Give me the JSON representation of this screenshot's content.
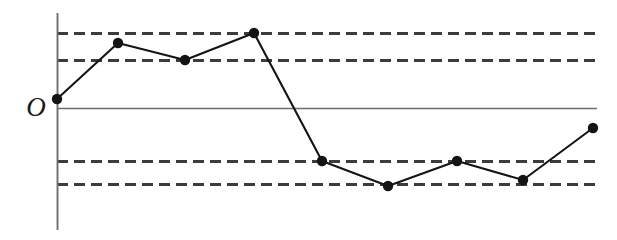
{
  "chart_data": {
    "type": "line",
    "title": "",
    "subtitle": "",
    "xlabel": "",
    "ylabel": "",
    "origin_label": "O",
    "grid": true,
    "legend": null,
    "annotations": [],
    "x": [
      1,
      2,
      3,
      4,
      5,
      6,
      7,
      8,
      9
    ],
    "xtick_labels": [
      "",
      "",
      "",
      "",
      "",
      "",
      "",
      "",
      ""
    ],
    "values": [
      0,
      3.8,
      3.2,
      4,
      -1.8,
      -2.7,
      -1.8,
      -2.5,
      -0.7
    ],
    "series": [
      {
        "name": "series-1",
        "values": [
          0,
          3.8,
          3.2,
          4,
          -1.8,
          -2.7,
          -1.8,
          -2.5,
          -0.7
        ]
      }
    ],
    "ylim": [
      -4.2,
      4.6
    ],
    "xlim": [
      0.85,
      9.4
    ],
    "gridline_values": [
      4,
      3.2,
      -1.8,
      -2.7
    ],
    "zero_axis_value": 0,
    "marker": "filled-circle",
    "marker_color": "#141414",
    "line_color": "#141414",
    "grid_color": "#3c3c3c",
    "axis_color": "#6e6e6e",
    "background_color": "#ffffff",
    "points_px": [
      {
        "x": 57,
        "y": 99
      },
      {
        "x": 118,
        "y": 43
      },
      {
        "x": 185,
        "y": 60
      },
      {
        "x": 254,
        "y": 33
      },
      {
        "x": 322,
        "y": 161
      },
      {
        "x": 388,
        "y": 186
      },
      {
        "x": 457,
        "y": 161
      },
      {
        "x": 523,
        "y": 180
      },
      {
        "x": 593,
        "y": 128
      }
    ],
    "gridlines_px_y": [
      33,
      60,
      161,
      184
    ],
    "zero_axis_px_y": 108,
    "y_axis_px_x": 57,
    "plot_right_px_x": 597,
    "y_axis_top_px": 13,
    "y_axis_bottom_px": 230
  }
}
